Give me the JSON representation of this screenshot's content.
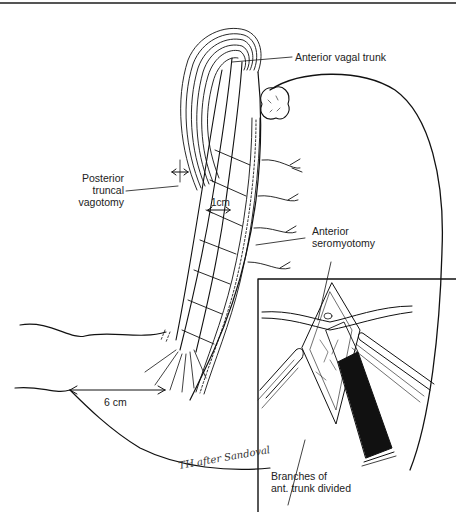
{
  "figure": {
    "type": "surgical line illustration",
    "colors": {
      "ink": "#111111",
      "paper": "#ffffff",
      "header_rule": "#555555"
    }
  },
  "labels": {
    "anterior_vagal_trunk": "Anterior vagal trunk",
    "posterior_truncal_vagotomy": [
      "Posterior",
      "truncal",
      "vagotomy"
    ],
    "anterior_seromyotomy": [
      "Anterior",
      "seromyotomy"
    ],
    "branches_divided": [
      "Branches of",
      "ant. trunk divided"
    ]
  },
  "measurements": {
    "seromyotomy_offset": "1cm",
    "distance_from_pylorus": "6 cm"
  },
  "signature": "TH after Sandoval",
  "inset": {
    "description": "Magnified view of seromyotomy incision with retractors and clamp"
  }
}
